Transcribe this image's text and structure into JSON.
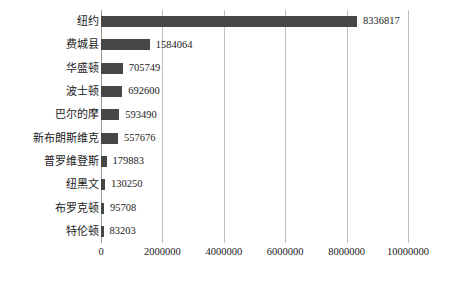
{
  "chart_data": {
    "type": "bar",
    "orientation": "horizontal",
    "title": "",
    "subtitle": "",
    "xlabel": "",
    "ylabel": "",
    "xlim": [
      0,
      10000000
    ],
    "ylim": null,
    "grid": true,
    "grid_axis": "x",
    "legend": false,
    "legend_position": "none",
    "bar_color": "#474747",
    "gridline_color": "#bfbfbf",
    "background_color": "#ffffff",
    "text_color": "#1a1a1a",
    "categories": [
      "纽约",
      "费城县",
      "华盛顿",
      "波士顿",
      "巴尔的摩",
      "新布朗斯维克",
      "普罗维登斯",
      "纽黑文",
      "布罗克顿",
      "特伦顿"
    ],
    "values": [
      8336817,
      1584064,
      705749,
      692600,
      593490,
      557676,
      179883,
      130250,
      95708,
      83203
    ],
    "data_labels": [
      "8336817",
      "1584064",
      "705749",
      "692600",
      "593490",
      "557676",
      "179883",
      "130250",
      "95708",
      "83203"
    ],
    "xticks": [
      0,
      2000000,
      4000000,
      6000000,
      8000000,
      10000000
    ],
    "xtick_labels": [
      "0",
      "2000000",
      "4000000",
      "6000000",
      "8000000",
      "10000000"
    ],
    "annotations": []
  }
}
